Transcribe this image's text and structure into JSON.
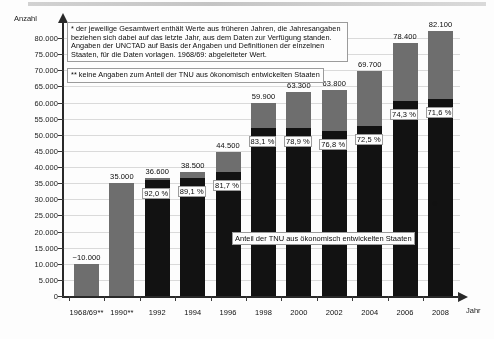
{
  "axis": {
    "y_title": "Anzahl",
    "x_title": "Jahr",
    "y_ticks": [
      "0",
      "5.000",
      "10.000",
      "15.000",
      "20.000",
      "25.000",
      "30.000",
      "35.000",
      "40.000",
      "45.000",
      "50.000",
      "55.000",
      "60.000",
      "65.000",
      "70.000",
      "75.000",
      "80.000"
    ]
  },
  "legend": {
    "series_note": "Anteil der TNU aus ökonomisch entwickelten Staaten"
  },
  "footnotes": {
    "one": "* der jeweilige Gesamtwert enthält Werte aus früheren Jahren, die Jahresangaben beziehen sich dabei auf das letzte Jahr, aus dem Daten zur Verfügung standen. Angaben der UNCTAD auf Basis der Angaben und Definitionen der einzelnen Staaten, für die Daten vorlagen. 1968/69: abgeleiteter Wert.",
    "two": "** keine Angaben zum Anteil der TNU aus ökonomisch entwickelten Staaten"
  },
  "colors": {
    "developed_share": "#141414",
    "total_remainder": "#6e6e6e",
    "axis": "#2b2b2b",
    "gridline": "#d8d8d8"
  },
  "chart_data": {
    "type": "bar",
    "title": "",
    "subtitle": "",
    "xlabel": "Jahr",
    "ylabel": "Anzahl",
    "ylim": [
      0,
      82000
    ],
    "grid": true,
    "legend_position": "inside-center",
    "categories": [
      "1968/69**",
      "1990**",
      "1992",
      "1994",
      "1996",
      "1998",
      "2000",
      "2002",
      "2004",
      "2006",
      "2008"
    ],
    "value_labels": [
      "~10.000",
      "35.000",
      "36.600",
      "38.500",
      "44.500",
      "59.900",
      "63.300",
      "63.800",
      "69.700",
      "78.400",
      "82.100"
    ],
    "values": [
      10000,
      35000,
      36600,
      38500,
      44500,
      59900,
      63300,
      63800,
      69700,
      78400,
      82100
    ],
    "pct_labels": [
      "",
      "",
      "92,0 %",
      "89,1 %",
      "81,7 %",
      "83,1 %",
      "78,9 %",
      "76,8 %",
      "72,5 %",
      "74,3 %",
      "71,6 %"
    ],
    "pct_values": [
      null,
      null,
      92.0,
      89.1,
      81.7,
      83.1,
      78.9,
      76.8,
      72.5,
      74.3,
      71.6
    ],
    "series": [
      {
        "name": "Anteil der TNU aus ökonomisch entwickelten Staaten",
        "color": "#141414"
      },
      {
        "name": "Gesamtwert (übrige)",
        "color": "#6e6e6e"
      }
    ]
  }
}
